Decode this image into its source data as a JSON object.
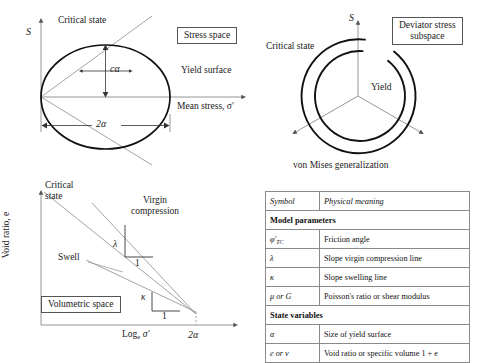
{
  "figure": {
    "panels": {
      "stress_space": {
        "box_label": "Stress space",
        "axis_y": "S",
        "axis_x": "Mean stress, σ′",
        "critical_state": "Critical state",
        "critical_state_lower": "Critical state",
        "yield_surface": "Yield surface",
        "dim_vertical": "cα",
        "dim_horizontal": "2α"
      },
      "deviator_subspace": {
        "box_label_line1": "Deviator stress",
        "box_label_line2": "subspace",
        "axis_y": "S",
        "critical_state": "Critical state",
        "yield": "Yield",
        "caption": "von Mises generalization"
      },
      "volumetric_space": {
        "box_label": "Volumetric space",
        "axis_y": "Void ratio, e",
        "axis_x": "Log",
        "axis_x_sub": "e",
        "axis_x_tail": "σ′",
        "x_tick": "2α",
        "critical_state_line1": "Critical",
        "critical_state_line2": "state",
        "virgin_line1": "Virgin",
        "virgin_line2": "compression",
        "swell": "Swell",
        "slope_lambda": "λ",
        "slope_lambda_run": "1",
        "slope_kappa": "κ",
        "slope_kappa_run": "1"
      }
    }
  },
  "table": {
    "header": {
      "symbol": "Symbol",
      "meaning": "Physical meaning"
    },
    "sections": [
      {
        "title": "Model parameters",
        "rows": [
          {
            "symbol": "φ′",
            "symbol_sub": "TC",
            "meaning": "Friction angle"
          },
          {
            "symbol": "λ",
            "symbol_sub": "",
            "meaning": "Slope virgin compression line"
          },
          {
            "symbol": "κ",
            "symbol_sub": "",
            "meaning": "Slope swelling line"
          },
          {
            "symbol": "μ or G",
            "symbol_sub": "",
            "meaning": "Poisson's ratio or shear modulus"
          }
        ]
      },
      {
        "title": "State variables",
        "rows": [
          {
            "symbol": "α",
            "symbol_sub": "",
            "meaning": "Size of yield surface"
          },
          {
            "symbol": "e or v",
            "symbol_sub": "",
            "meaning": "Void ratio or specific volume 1 + e"
          }
        ]
      }
    ]
  },
  "colors": {
    "ink": "#1a1a1a",
    "thick_curve": "#111111",
    "thin_line": "#7d7d7d",
    "table_border": "#8a8a8a"
  }
}
